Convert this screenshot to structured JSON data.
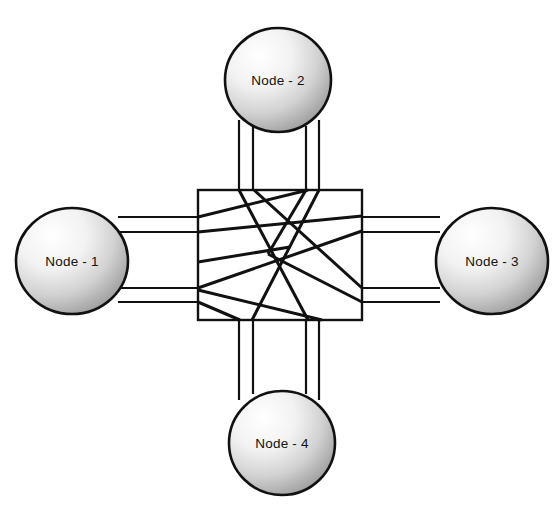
{
  "diagram": {
    "type": "crossbar-network-diagram",
    "background_color": "#ffffff",
    "line_color": "#111111",
    "node_fill_light": "#ffffff",
    "node_fill_dark": "#9a9a9a",
    "node_stroke_color": "#111111",
    "node_stroke_width": 2.6,
    "link_stroke_width": 2.2,
    "switch_stroke_width": 2.4,
    "internal_stroke_width": 3.0
  },
  "switch": {
    "name": "central-switch-fabric",
    "x": 198,
    "y": 190,
    "width": 164,
    "height": 130,
    "fill": "#ffffff"
  },
  "nodes": [
    {
      "id": "node-1",
      "label": "Node - 1",
      "position": "left",
      "cx": 72,
      "cy": 261,
      "rx": 56,
      "ry": 53
    },
    {
      "id": "node-2",
      "label": "Node - 2",
      "position": "top",
      "cx": 278,
      "cy": 80,
      "rx": 53,
      "ry": 52
    },
    {
      "id": "node-3",
      "label": "Node - 3",
      "position": "right",
      "cx": 492,
      "cy": 261,
      "rx": 56,
      "ry": 53
    },
    {
      "id": "node-4",
      "label": "Node - 4",
      "position": "bottom",
      "cx": 282,
      "cy": 443,
      "rx": 53,
      "ry": 52
    }
  ],
  "bundles": [
    {
      "id": "bundle-left",
      "node": "node-1",
      "orientation": "horizontal",
      "line_count": 4,
      "offsets": [
        217,
        232,
        288,
        302
      ],
      "from": 118,
      "to": 198
    },
    {
      "id": "bundle-top",
      "node": "node-2",
      "orientation": "vertical",
      "line_count": 4,
      "offsets": [
        239,
        253,
        306,
        319
      ],
      "from": 122,
      "to": 190
    },
    {
      "id": "bundle-right",
      "node": "node-3",
      "orientation": "horizontal",
      "line_count": 4,
      "offsets": [
        217,
        232,
        288,
        302
      ],
      "from": 362,
      "to": 440
    },
    {
      "id": "bundle-bottom",
      "node": "node-4",
      "orientation": "vertical",
      "line_count": 4,
      "offsets": [
        239,
        253,
        306,
        319
      ],
      "from": 320,
      "to": 396
    }
  ],
  "internal_paths": [
    {
      "id": "path-1",
      "x1": 198,
      "y1": 217,
      "x2": 306,
      "y2": 190
    },
    {
      "id": "path-2",
      "x1": 198,
      "y1": 232,
      "x2": 362,
      "y2": 217
    },
    {
      "id": "path-3",
      "x1": 198,
      "y1": 288,
      "x2": 362,
      "y2": 232
    },
    {
      "id": "path-4",
      "x1": 198,
      "y1": 302,
      "x2": 239,
      "y2": 320
    },
    {
      "id": "path-5",
      "x1": 239,
      "y1": 190,
      "x2": 306,
      "y2": 320
    },
    {
      "id": "path-6",
      "x1": 253,
      "y1": 190,
      "x2": 362,
      "y2": 288
    },
    {
      "id": "path-7",
      "x1": 319,
      "y1": 190,
      "x2": 253,
      "y2": 320
    },
    {
      "id": "path-8",
      "x1": 198,
      "y1": 288,
      "x2": 319,
      "y2": 320
    },
    {
      "id": "path-9",
      "x1": 362,
      "y1": 302,
      "x2": 253,
      "y2": 262
    },
    {
      "id": "path-10",
      "x1": 306,
      "y1": 190,
      "x2": 272,
      "y2": 252
    },
    {
      "id": "path-11",
      "x1": 272,
      "y1": 252,
      "x2": 362,
      "y2": 302
    }
  ]
}
